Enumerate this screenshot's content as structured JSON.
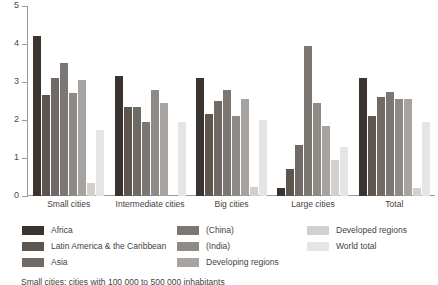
{
  "chart_data": {
    "type": "bar",
    "title": "",
    "xlabel": "",
    "ylabel": "",
    "ylim": [
      0,
      5
    ],
    "yticks": [
      "0",
      "1",
      "2",
      "3",
      "4",
      "5"
    ],
    "grid": false,
    "legend_position": "bottom",
    "categories": [
      "Small cities",
      "Intermediate cities",
      "Big cities",
      "Large cities",
      "Total"
    ],
    "series": [
      {
        "name": "Africa",
        "color": "#3b332f",
        "values": [
          4.2,
          3.15,
          3.1,
          0.2,
          3.1
        ]
      },
      {
        "name": "Latin America & the Caribbean",
        "color": "#5e554f",
        "values": [
          2.65,
          2.35,
          2.15,
          0.7,
          2.1
        ]
      },
      {
        "name": "Asia",
        "color": "#6f6a66",
        "values": [
          3.1,
          2.35,
          2.5,
          1.35,
          2.6
        ]
      },
      {
        "name": "(China)",
        "color": "#7c7772",
        "values": [
          3.5,
          1.95,
          2.8,
          3.95,
          2.75
        ]
      },
      {
        "name": "(India)",
        "color": "#8e8a86",
        "values": [
          2.7,
          2.8,
          2.1,
          2.45,
          2.55
        ]
      },
      {
        "name": "Developing regions",
        "color": "#a6a3a0",
        "values": [
          3.05,
          2.45,
          2.55,
          1.85,
          2.55
        ]
      },
      {
        "name": "Developed regions",
        "color": "#d2d0ce",
        "values": [
          0.35,
          0.0,
          0.25,
          0.95,
          0.2
        ]
      },
      {
        "name": "World total",
        "color": "#e6e5e3",
        "values": [
          1.75,
          1.95,
          2.0,
          1.3,
          1.95
        ]
      }
    ]
  },
  "footnote": "Small cities: cities with 100 000 to 500 000 inhabitants"
}
